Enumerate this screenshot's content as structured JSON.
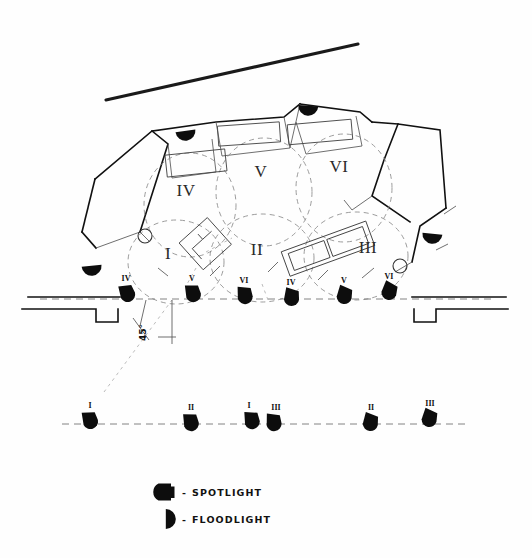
{
  "document": {
    "type": "hand-drawn stage lighting plot",
    "title": "",
    "background_color": "#ffffff",
    "ink_color": "#111111"
  },
  "legend": {
    "items": [
      {
        "symbol": "spotlight-symbol",
        "dash": "-",
        "label": "SPOTLIGHT"
      },
      {
        "symbol": "floodlight-symbol",
        "dash": "-",
        "label": "FLOODLIGHT"
      }
    ]
  },
  "annotations": {
    "angle": "45°"
  },
  "stage_zones": [
    {
      "id": "zone-4",
      "numeral": "IV",
      "x": 186,
      "y": 196
    },
    {
      "id": "zone-5",
      "numeral": "V",
      "x": 261,
      "y": 177
    },
    {
      "id": "zone-6",
      "numeral": "VI",
      "x": 339,
      "y": 172
    },
    {
      "id": "zone-1",
      "numeral": "I",
      "x": 168,
      "y": 259
    },
    {
      "id": "zone-2",
      "numeral": "II",
      "x": 257,
      "y": 255
    },
    {
      "id": "zone-3",
      "numeral": "III",
      "x": 368,
      "y": 253
    }
  ],
  "front_bar_lights": [
    {
      "id": "fob-1",
      "numeral": "IV",
      "x": 127,
      "y": 292,
      "rotation": -18
    },
    {
      "id": "fob-2",
      "numeral": "V",
      "x": 193,
      "y": 292,
      "rotation": -12
    },
    {
      "id": "fob-3",
      "numeral": "VI",
      "x": 245,
      "y": 294,
      "rotation": -6
    },
    {
      "id": "fob-4",
      "numeral": "IV",
      "x": 292,
      "y": 296,
      "rotation": 6
    },
    {
      "id": "fob-5",
      "numeral": "V",
      "x": 345,
      "y": 294,
      "rotation": 12
    },
    {
      "id": "fob-6",
      "numeral": "VI",
      "x": 390,
      "y": 290,
      "rotation": 18
    }
  ],
  "rear_bar_lights": [
    {
      "id": "rob-1",
      "numeral": "I",
      "x": 90,
      "y": 419,
      "rotation": -14
    },
    {
      "id": "rob-2",
      "numeral": "II",
      "x": 191,
      "y": 421,
      "rotation": -10
    },
    {
      "id": "rob-3",
      "numeral": "I",
      "x": 252,
      "y": 419,
      "rotation": -8
    },
    {
      "id": "rob-4",
      "numeral": "III",
      "x": 274,
      "y": 421,
      "rotation": -4
    },
    {
      "id": "rob-5",
      "numeral": "II",
      "x": 371,
      "y": 421,
      "rotation": 10
    },
    {
      "id": "rob-6",
      "numeral": "III",
      "x": 430,
      "y": 417,
      "rotation": 14
    }
  ],
  "floodlights": [
    {
      "id": "flood-top-left",
      "x": 186,
      "y": 135,
      "rotation": -8
    },
    {
      "id": "flood-top-right",
      "x": 308,
      "y": 110,
      "rotation": 4
    },
    {
      "id": "flood-left",
      "x": 92,
      "y": 270,
      "rotation": -6
    },
    {
      "id": "flood-right",
      "x": 432,
      "y": 238,
      "rotation": 6
    }
  ],
  "pivot_circles": [
    {
      "id": "pivot-left",
      "x": 145,
      "y": 236,
      "r": 7
    },
    {
      "id": "pivot-right",
      "x": 400,
      "y": 266,
      "r": 7
    }
  ]
}
